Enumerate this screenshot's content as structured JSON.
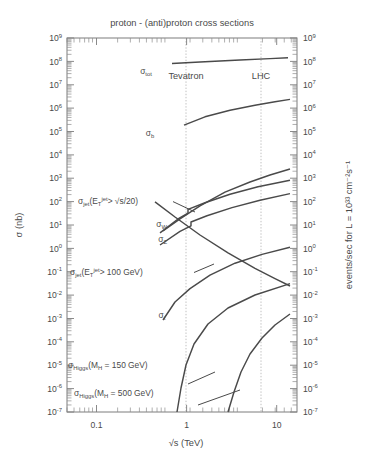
{
  "figure": {
    "title": "proton - (anti)proton cross sections",
    "xlabel": "√s (TeV)",
    "ylabel_left": "σ (nb)",
    "ylabel_right": "events/sec for L = 10³³ cm⁻²s⁻¹"
  },
  "axis": {
    "x_ticklabels": [
      "0.1",
      "1",
      "10"
    ],
    "y_mantissa": "10",
    "y_exponents": [
      "9",
      "8",
      "7",
      "6",
      "5",
      "4",
      "3",
      "2",
      "1",
      "0",
      "-1",
      "-2",
      "-3",
      "-4",
      "-5",
      "-6",
      "-7"
    ]
  },
  "markers": [
    {
      "name": "Tevatron",
      "label": "Tevatron",
      "sqrt_s_TeV": 1.96
    },
    {
      "name": "LHC",
      "label": "LHC",
      "sqrt_s_TeV": 14
    }
  ],
  "curve_labels": {
    "sigma_tot": {
      "base": "σ",
      "sub": "tot"
    },
    "sigma_b": {
      "base": "σ",
      "sub": "b"
    },
    "sigma_jet_sqrts": {
      "part1": "σ",
      "sub1": "jet",
      "part2": "(E",
      "sub2": "T",
      "sup2": "jet",
      "part3": "> √s/20)"
    },
    "sigma_jet_100": {
      "part1": "σ",
      "sub1": "jet",
      "part2": "(E",
      "sub2": "T",
      "sup2": "jet",
      "part3": "> 100 GeV)"
    },
    "sigma_w": {
      "base": "σ",
      "sub": "W"
    },
    "sigma_z": {
      "base": "σ",
      "sub": "Z"
    },
    "sigma_t": {
      "base": "σ",
      "sub": "t"
    },
    "sigma_higgs_150": {
      "base": "σ",
      "sub": "Higgs",
      "rest": "(M",
      "sub2": "H",
      "rest2": " = 150 GeV)"
    },
    "sigma_higgs_500": {
      "base": "σ",
      "sub": "Higgs",
      "rest": "(M",
      "sub2": "H",
      "rest2": " = 500 GeV)"
    }
  },
  "chart_data": {
    "type": "line",
    "title": "proton - (anti)proton cross sections",
    "xlabel": "√s (TeV)",
    "ylabel": "σ (nb)",
    "ylabel_secondary": "events/sec for L = 10³³ cm⁻²s⁻¹",
    "xscale": "log",
    "yscale": "log",
    "xlim": [
      0.04,
      60
    ],
    "ylim": [
      1e-07,
      1000000000.0
    ],
    "grid": false,
    "legend": "inline-annotations",
    "xticks": [
      0.1,
      1,
      10
    ],
    "yticks": [
      1000000000.0,
      100000000.0,
      10000000.0,
      1000000.0,
      100000.0,
      10000.0,
      1000.0,
      100.0,
      10.0,
      1.0,
      0.1,
      0.01,
      0.001,
      0.0001,
      1e-05,
      1e-06,
      1e-07
    ],
    "vertical_markers": [
      {
        "label": "Tevatron",
        "x": 1.96
      },
      {
        "label": "LHC",
        "x": 14
      }
    ],
    "series": [
      {
        "name": "sigma_tot",
        "label": "σ_tot",
        "x": [
          0.9,
          2.0,
          5.0,
          14.0,
          40.0
        ],
        "y": [
          63000000.0,
          72000000.0,
          86000000.0,
          100000000.0,
          115000000.0
        ]
      },
      {
        "name": "sigma_b",
        "label": "σ_b",
        "x": [
          1.1,
          2.0,
          5.0,
          14.0,
          40.0
        ],
        "y": [
          110000.0,
          260000.0,
          700000.0,
          1600000.0,
          3000000.0
        ]
      },
      {
        "name": "sigma_jet_ET_gt_sqrts_over_20",
        "label": "σ_jet(E_T^jet > √s/20)",
        "x": [
          0.55,
          1.0,
          2.0,
          5.0,
          14.0,
          40.0
        ],
        "y": [
          2.0,
          8.0,
          30.0,
          200.0,
          1300.0,
          6000.0
        ]
      },
      {
        "name": "sigma_W",
        "label": "σ_W",
        "x": [
          0.5,
          1.0,
          1.8,
          1.8,
          3.0,
          8.0,
          20.0,
          40.0
        ],
        "y": [
          1.8,
          8.0,
          22.0,
          32.0,
          50.0,
          110.0,
          200.0,
          300.0
        ]
      },
      {
        "name": "sigma_Z",
        "label": "σ_Z",
        "x": [
          0.5,
          1.0,
          1.9,
          1.9,
          3.0,
          8.0,
          20.0,
          40.0
        ],
        "y": [
          0.5,
          2.4,
          6.5,
          9.5,
          15.0,
          34.0,
          62.0,
          90.0
        ]
      },
      {
        "name": "sigma_jet_ET_gt_100GeV",
        "label": "σ_jet(E_T^jet > 100 GeV)",
        "x": [
          0.45,
          1.0,
          2.0,
          5.0,
          14.0,
          40.0
        ],
        "y": [
          200.0,
          30.0,
          5.0,
          0.4,
          0.04,
          0.005
        ]
      },
      {
        "name": "sigma_t",
        "label": "σ_t",
        "x": [
          0.6,
          1.0,
          2.0,
          5.0,
          14.0,
          40.0
        ],
        "y": [
          0.0002,
          0.0025,
          0.012,
          0.1,
          0.5,
          1.6
        ]
      },
      {
        "name": "sigma_Higgs_MH_150GeV",
        "label": "σ_Higgs(M_H = 150 GeV)",
        "x": [
          1.3,
          2.0,
          5.0,
          14.0,
          40.0
        ],
        "y": [
          1e-07,
          6e-06,
          0.0002,
          0.002,
          0.012
        ]
      },
      {
        "name": "sigma_Higgs_MH_500GeV",
        "label": "σ_Higgs(M_H = 500 GeV)",
        "x": [
          5.0,
          9.0,
          14.0,
          25.0,
          40.0
        ],
        "y": [
          1e-07,
          1.2e-05,
          7e-05,
          0.00035,
          0.0009
        ]
      }
    ]
  }
}
